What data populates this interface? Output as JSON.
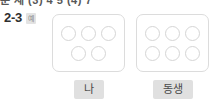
{
  "page": {
    "background_color": "#ffffff",
    "clipped_header_text": "문 제 (3) 4 5  (4) 7"
  },
  "problem": {
    "number": "2-3",
    "badge_label": "예"
  },
  "groups": [
    {
      "name": "me",
      "label": "나",
      "count": 5,
      "rows": [
        3,
        2
      ]
    },
    {
      "name": "sibling",
      "label": "동생",
      "count": 6,
      "rows": [
        3,
        3
      ]
    }
  ],
  "colors": {
    "box_border": "#dcdcdc",
    "dot_border": "#d5d5d5",
    "chip_background": "#e0e0e0",
    "chip_text": "#4a4a4a",
    "badge_background": "#e3e3e3",
    "badge_text": "#8a8a8a",
    "number_text": "#2f2f2f"
  }
}
